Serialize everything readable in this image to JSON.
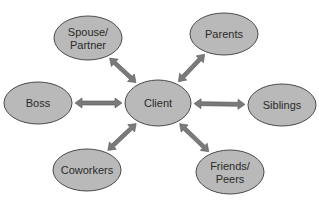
{
  "diagram": {
    "type": "hub-and-spoke relationship diagram",
    "center": {
      "label": "Client",
      "cx": 158,
      "cy": 103,
      "rx": 33,
      "ry": 23
    },
    "nodes": [
      {
        "id": "spouse",
        "lines": [
          "Spouse/",
          "Partner"
        ],
        "cx": 88,
        "cy": 38,
        "rx": 34,
        "ry": 22
      },
      {
        "id": "parents",
        "lines": [
          "Parents"
        ],
        "cx": 224,
        "cy": 34,
        "rx": 34,
        "ry": 21
      },
      {
        "id": "boss",
        "lines": [
          "Boss"
        ],
        "cx": 38,
        "cy": 103,
        "rx": 34,
        "ry": 21
      },
      {
        "id": "siblings",
        "lines": [
          "Siblings"
        ],
        "cx": 282,
        "cy": 105,
        "rx": 34,
        "ry": 21
      },
      {
        "id": "coworkers",
        "lines": [
          "Coworkers"
        ],
        "cx": 87,
        "cy": 170,
        "rx": 34,
        "ry": 21
      },
      {
        "id": "friends",
        "lines": [
          "Friends/",
          "Peers"
        ],
        "cx": 230,
        "cy": 172,
        "rx": 34,
        "ry": 22
      }
    ],
    "edges": [
      {
        "from": "client",
        "to": "spouse",
        "bidirectional": true
      },
      {
        "from": "client",
        "to": "parents",
        "bidirectional": true
      },
      {
        "from": "client",
        "to": "boss",
        "bidirectional": true
      },
      {
        "from": "client",
        "to": "siblings",
        "bidirectional": true
      },
      {
        "from": "client",
        "to": "coworkers",
        "bidirectional": true
      },
      {
        "from": "client",
        "to": "friends",
        "bidirectional": true
      }
    ],
    "colors": {
      "node_fill": "#b9b9b9",
      "node_stroke": "#4a4a4a",
      "arrow_fill": "#7a7a7a",
      "text": "#2a2a2a",
      "background": "#ffffff"
    }
  }
}
